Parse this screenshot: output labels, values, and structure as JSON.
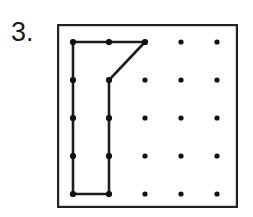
{
  "exercise": {
    "number_label": "3.",
    "type": "geoboard-polygon",
    "instruction_visible": false
  },
  "board": {
    "frame": {
      "x": 57,
      "y": 24,
      "width": 181,
      "height": 184,
      "stroke_color": "#242424",
      "fill_color": "#ffffff",
      "stroke_width": 2.2
    },
    "grid": {
      "rows": 5,
      "columns": 5,
      "origin_x": 73,
      "origin_y": 42,
      "spacing_x": 36,
      "spacing_y": 38,
      "dot_radius": 2.6,
      "dot_color": "#111111"
    }
  },
  "chart_data": {
    "type": "scatter",
    "title": "",
    "xlabel": "",
    "ylabel": "",
    "grid": true,
    "legend_position": "none",
    "xlim": [
      1,
      5
    ],
    "ylim": [
      1,
      5
    ],
    "peg_points": [
      {
        "col": 1,
        "row": 1
      },
      {
        "col": 2,
        "row": 1
      },
      {
        "col": 3,
        "row": 1
      },
      {
        "col": 4,
        "row": 1
      },
      {
        "col": 5,
        "row": 1
      },
      {
        "col": 1,
        "row": 2
      },
      {
        "col": 2,
        "row": 2
      },
      {
        "col": 3,
        "row": 2
      },
      {
        "col": 4,
        "row": 2
      },
      {
        "col": 5,
        "row": 2
      },
      {
        "col": 1,
        "row": 3
      },
      {
        "col": 2,
        "row": 3
      },
      {
        "col": 3,
        "row": 3
      },
      {
        "col": 4,
        "row": 3
      },
      {
        "col": 5,
        "row": 3
      },
      {
        "col": 1,
        "row": 4
      },
      {
        "col": 2,
        "row": 4
      },
      {
        "col": 3,
        "row": 4
      },
      {
        "col": 4,
        "row": 4
      },
      {
        "col": 5,
        "row": 4
      },
      {
        "col": 1,
        "row": 5
      },
      {
        "col": 2,
        "row": 5
      },
      {
        "col": 3,
        "row": 5
      },
      {
        "col": 4,
        "row": 5
      },
      {
        "col": 5,
        "row": 5
      }
    ],
    "series": [
      {
        "name": "polygon",
        "closed": true,
        "vertices": [
          {
            "col": 1,
            "row": 1
          },
          {
            "col": 3,
            "row": 1
          },
          {
            "col": 2,
            "row": 2
          },
          {
            "col": 2,
            "row": 5
          },
          {
            "col": 1,
            "row": 5
          }
        ]
      }
    ],
    "edge_midpoint_pegs": [
      {
        "col": 2,
        "row": 1
      },
      {
        "col": 1,
        "row": 2
      },
      {
        "col": 1,
        "row": 3
      },
      {
        "col": 2,
        "row": 3
      },
      {
        "col": 1,
        "row": 4
      },
      {
        "col": 2,
        "row": 4
      }
    ]
  }
}
